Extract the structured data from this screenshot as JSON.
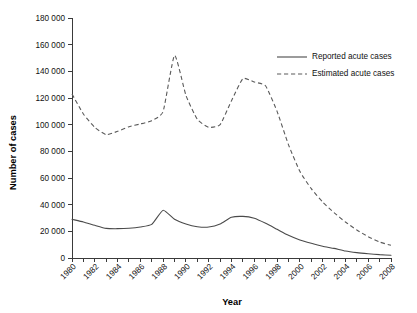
{
  "chart_data": {
    "type": "line",
    "title": "",
    "xlabel": "Year",
    "ylabel": "Number of cases",
    "xlim": [
      1980,
      2008
    ],
    "ylim": [
      0,
      180000
    ],
    "grid": false,
    "legend_position": "top-right",
    "x": [
      1980,
      1981,
      1982,
      1983,
      1984,
      1985,
      1986,
      1987,
      1988,
      1989,
      1990,
      1991,
      1992,
      1993,
      1994,
      1995,
      1996,
      1997,
      1998,
      1999,
      2000,
      2001,
      2002,
      2003,
      2004,
      2005,
      2006,
      2007,
      2008
    ],
    "series": [
      {
        "name": "Reported acute cases",
        "style": "solid",
        "color": "#4a4a4a",
        "values": [
          29000,
          27000,
          24500,
          22200,
          22000,
          22300,
          23300,
          25200,
          35800,
          29000,
          25500,
          23500,
          23200,
          25500,
          30500,
          31200,
          29800,
          26000,
          21500,
          17000,
          13500,
          11000,
          8800,
          7200,
          5200,
          4000,
          3200,
          2500,
          2100
        ]
      },
      {
        "name": "Estimated acute cases",
        "style": "dashed",
        "color": "#5a5a5a",
        "values": [
          123000,
          108000,
          98000,
          92500,
          95000,
          98500,
          100500,
          103000,
          110000,
          152000,
          122000,
          104000,
          98000,
          100000,
          118000,
          134500,
          132000,
          129000,
          110000,
          85000,
          65000,
          52000,
          42000,
          34000,
          27000,
          21000,
          16000,
          12000,
          9500
        ]
      }
    ],
    "y_ticks": [
      {
        "value": 0,
        "label": "0"
      },
      {
        "value": 20000,
        "label": "20 000"
      },
      {
        "value": 40000,
        "label": "40 000"
      },
      {
        "value": 60000,
        "label": "60 000"
      },
      {
        "value": 80000,
        "label": "80 000"
      },
      {
        "value": 100000,
        "label": "100 000"
      },
      {
        "value": 120000,
        "label": "120 000"
      },
      {
        "value": 140000,
        "label": "140 000"
      },
      {
        "value": 160000,
        "label": "160 000"
      },
      {
        "value": 180000,
        "label": "180 000"
      }
    ],
    "x_ticks": [
      {
        "value": 1980,
        "label": "1980"
      },
      {
        "value": 1981,
        "label": ""
      },
      {
        "value": 1982,
        "label": "1982"
      },
      {
        "value": 1983,
        "label": ""
      },
      {
        "value": 1984,
        "label": "1984"
      },
      {
        "value": 1985,
        "label": ""
      },
      {
        "value": 1986,
        "label": "1986"
      },
      {
        "value": 1987,
        "label": ""
      },
      {
        "value": 1988,
        "label": "1988"
      },
      {
        "value": 1989,
        "label": ""
      },
      {
        "value": 1990,
        "label": "1990"
      },
      {
        "value": 1991,
        "label": ""
      },
      {
        "value": 1992,
        "label": "1992"
      },
      {
        "value": 1993,
        "label": ""
      },
      {
        "value": 1994,
        "label": "1994"
      },
      {
        "value": 1995,
        "label": ""
      },
      {
        "value": 1996,
        "label": "1996"
      },
      {
        "value": 1997,
        "label": ""
      },
      {
        "value": 1998,
        "label": "1998"
      },
      {
        "value": 1999,
        "label": ""
      },
      {
        "value": 2000,
        "label": "2000"
      },
      {
        "value": 2001,
        "label": ""
      },
      {
        "value": 2002,
        "label": "2002"
      },
      {
        "value": 2003,
        "label": ""
      },
      {
        "value": 2004,
        "label": "2004"
      },
      {
        "value": 2005,
        "label": ""
      },
      {
        "value": 2006,
        "label": "2006"
      },
      {
        "value": 2007,
        "label": ""
      },
      {
        "value": 2008,
        "label": "2008"
      }
    ],
    "legend": [
      {
        "label": "Reported acute cases",
        "style": "solid"
      },
      {
        "label": "Estimated acute cases",
        "style": "dashed"
      }
    ]
  }
}
